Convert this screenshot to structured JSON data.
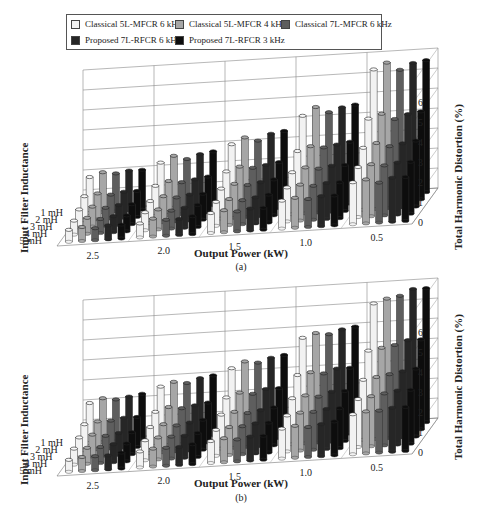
{
  "legend": {
    "items": [
      {
        "label": "Classical 5L-MFCR 6 kHz",
        "color": "#f2f2f2"
      },
      {
        "label": "Classical 5L-MFCR 4 kHz",
        "color": "#a6a6a6"
      },
      {
        "label": "Classical 7L-MFCR 6 kHz",
        "color": "#5e5e5e"
      },
      {
        "label": "Proposed 7L-RFCR 6 kHz",
        "color": "#262626"
      },
      {
        "label": "Proposed 7L-RFCR 3 kHz",
        "color": "#0d0d0d"
      }
    ]
  },
  "charts": [
    {
      "caption": "(a)",
      "xlabel": "Output Power (kW)",
      "ylabel": "Input Filter Inductance",
      "zlabel": "Total Harmonic Distortion (%)",
      "x_ticks": [
        "2.5",
        "2.0",
        "1.5",
        "1.0",
        "0.5"
      ],
      "y_ticks": [
        "1 mH",
        "2 mH",
        "3 mH",
        "4 mH",
        "5 mH"
      ],
      "z_ticks": [
        "0",
        "1",
        "2",
        "3",
        "4",
        "5",
        "6"
      ]
    },
    {
      "caption": "(b)",
      "xlabel": "Output Power (kW)",
      "ylabel": "Input Filter Inductance",
      "zlabel": "Total Harmonic Distortion (%)",
      "x_ticks": [
        "2.5",
        "2.0",
        "1.5",
        "1.0",
        "0.5"
      ],
      "y_ticks": [
        "1 mH",
        "2 mH",
        "3 mH",
        "4 mH",
        "5 mH"
      ],
      "z_ticks": [
        "0",
        "1",
        "2",
        "3",
        "4",
        "5",
        "6"
      ]
    }
  ],
  "chart_data": [
    {
      "type": "bar",
      "subtype": "3d-bar",
      "title": "(a)",
      "xlabel": "Output Power (kW)",
      "ylabel": "Input Filter Inductance",
      "zlabel": "Total Harmonic Distortion (%)",
      "categories": [
        "2.5",
        "2.0",
        "1.5",
        "1.0",
        "0.5"
      ],
      "depth_categories": [
        "1 mH",
        "2 mH",
        "3 mH",
        "4 mH",
        "5 mH"
      ],
      "zlim": [
        0,
        7
      ],
      "grid": true,
      "legend_position": "top",
      "series": [
        {
          "name": "Classical 5L-MFCR 6 kHz",
          "values": [
            [
              1.8,
              1.2,
              0.9,
              0.7,
              0.6
            ],
            [
              2.3,
              1.5,
              1.1,
              0.9,
              0.7
            ],
            [
              3.0,
              2.0,
              1.5,
              1.2,
              1.0
            ],
            [
              4.2,
              2.8,
              2.1,
              1.7,
              1.4
            ],
            [
              6.3,
              4.2,
              3.1,
              2.5,
              2.1
            ]
          ]
        },
        {
          "name": "Classical 5L-MFCR 4 kHz",
          "values": [
            [
              2.0,
              1.3,
              1.0,
              0.8,
              0.7
            ],
            [
              2.6,
              1.7,
              1.3,
              1.0,
              0.9
            ],
            [
              3.3,
              2.2,
              1.7,
              1.3,
              1.1
            ],
            [
              4.6,
              3.0,
              2.3,
              1.8,
              1.5
            ],
            [
              6.6,
              4.4,
              3.3,
              2.6,
              2.2
            ]
          ]
        },
        {
          "name": "Classical 7L-MFCR 6 kHz",
          "values": [
            [
              1.9,
              1.2,
              0.9,
              0.7,
              0.6
            ],
            [
              2.4,
              1.6,
              1.2,
              0.9,
              0.8
            ],
            [
              3.1,
              2.1,
              1.6,
              1.2,
              1.0
            ],
            [
              4.3,
              2.9,
              2.2,
              1.7,
              1.4
            ],
            [
              6.2,
              4.1,
              3.1,
              2.5,
              2.0
            ]
          ]
        },
        {
          "name": "Proposed 7L-RFCR 6 kHz",
          "values": [
            [
              2.0,
              1.3,
              1.0,
              0.8,
              0.7
            ],
            [
              2.6,
              1.7,
              1.3,
              1.0,
              0.8
            ],
            [
              3.4,
              2.2,
              1.7,
              1.3,
              1.1
            ],
            [
              4.5,
              3.0,
              2.3,
              1.8,
              1.5
            ],
            [
              6.5,
              4.3,
              3.2,
              2.6,
              2.2
            ]
          ]
        },
        {
          "name": "Proposed 7L-RFCR 3 kHz",
          "values": [
            [
              2.0,
              1.3,
              1.0,
              0.8,
              0.7
            ],
            [
              2.7,
              1.8,
              1.3,
              1.1,
              0.9
            ],
            [
              3.5,
              2.3,
              1.8,
              1.4,
              1.1
            ],
            [
              4.6,
              3.1,
              2.3,
              1.8,
              1.5
            ],
            [
              6.6,
              4.4,
              3.3,
              2.6,
              2.2
            ]
          ]
        }
      ]
    },
    {
      "type": "bar",
      "subtype": "3d-bar",
      "title": "(b)",
      "xlabel": "Output Power (kW)",
      "ylabel": "Input Filter Inductance",
      "zlabel": "Total Harmonic Distortion (%)",
      "categories": [
        "2.5",
        "2.0",
        "1.5",
        "1.0",
        "0.5"
      ],
      "depth_categories": [
        "1 mH",
        "2 mH",
        "3 mH",
        "4 mH",
        "5 mH"
      ],
      "zlim": [
        0,
        7
      ],
      "grid": true,
      "legend_position": "top",
      "series": [
        {
          "name": "Classical 5L-MFCR 6 kHz",
          "values": [
            [
              2.0,
              1.3,
              1.0,
              0.8,
              0.6
            ],
            [
              2.6,
              1.7,
              1.3,
              1.0,
              0.8
            ],
            [
              3.3,
              2.2,
              1.7,
              1.3,
              1.1
            ],
            [
              4.6,
              3.1,
              2.3,
              1.8,
              1.5
            ],
            [
              6.1,
              4.1,
              3.0,
              2.4,
              2.0
            ]
          ]
        },
        {
          "name": "Classical 5L-MFCR 4 kHz",
          "values": [
            [
              2.2,
              1.4,
              1.1,
              0.8,
              0.7
            ],
            [
              2.8,
              1.9,
              1.4,
              1.1,
              0.9
            ],
            [
              3.6,
              2.4,
              1.8,
              1.4,
              1.2
            ],
            [
              4.8,
              3.2,
              2.4,
              1.9,
              1.6
            ],
            [
              6.3,
              4.2,
              3.1,
              2.5,
              2.1
            ]
          ]
        },
        {
          "name": "Classical 7L-MFCR 6 kHz",
          "values": [
            [
              2.1,
              1.4,
              1.0,
              0.8,
              0.7
            ],
            [
              2.7,
              1.8,
              1.3,
              1.1,
              0.9
            ],
            [
              3.5,
              2.3,
              1.7,
              1.4,
              1.1
            ],
            [
              4.7,
              3.1,
              2.3,
              1.9,
              1.5
            ],
            [
              6.4,
              4.3,
              3.2,
              2.6,
              2.1
            ]
          ]
        },
        {
          "name": "Proposed 7L-RFCR 6 kHz",
          "values": [
            [
              2.2,
              1.5,
              1.1,
              0.9,
              0.7
            ],
            [
              2.9,
              1.9,
              1.4,
              1.1,
              0.9
            ],
            [
              3.7,
              2.5,
              1.8,
              1.5,
              1.2
            ],
            [
              4.9,
              3.3,
              2.5,
              2.0,
              1.6
            ],
            [
              6.7,
              4.5,
              3.3,
              2.7,
              2.2
            ]
          ]
        },
        {
          "name": "Proposed 7L-RFCR 3 kHz",
          "values": [
            [
              2.3,
              1.5,
              1.1,
              0.9,
              0.8
            ],
            [
              3.0,
              2.0,
              1.5,
              1.2,
              1.0
            ],
            [
              3.8,
              2.5,
              1.9,
              1.5,
              1.2
            ],
            [
              5.0,
              3.3,
              2.5,
              2.0,
              1.7
            ],
            [
              6.7,
              4.5,
              3.4,
              2.7,
              2.2
            ]
          ]
        }
      ]
    }
  ]
}
